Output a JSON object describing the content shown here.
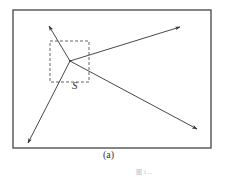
{
  "figure": {
    "caption": "(a)",
    "region_label": "S",
    "footer_text": "图 1  ...",
    "colors": {
      "line": "#333333",
      "frame": "#444444",
      "dashed": "#555555",
      "background": "#ffffff"
    },
    "frame": {
      "x": 13,
      "y": 10,
      "width": 198,
      "height": 138
    },
    "dashed_box": {
      "x": 50,
      "y": 41,
      "width": 39,
      "height": 41
    },
    "vertex": {
      "x": 70,
      "y": 61
    },
    "arrows": [
      {
        "name": "arrow-up-left",
        "to": {
          "x": 49,
          "y": 26
        }
      },
      {
        "name": "arrow-up-right",
        "to": {
          "x": 180,
          "y": 27
        }
      },
      {
        "name": "arrow-down-right",
        "to": {
          "x": 197,
          "y": 129
        }
      },
      {
        "name": "arrow-down-left",
        "to": {
          "x": 28,
          "y": 143
        }
      }
    ]
  }
}
